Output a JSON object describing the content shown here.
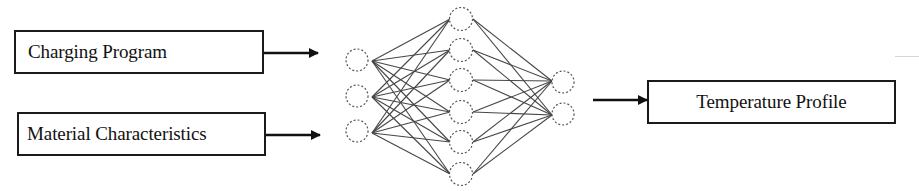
{
  "diagram": {
    "inputs": [
      {
        "label": "Charging Program"
      },
      {
        "label": "Material Characteristics"
      }
    ],
    "output": {
      "label": "Temperature Profile"
    },
    "network": {
      "type": "fully-connected feedforward neural network",
      "layers": [
        {
          "name": "input",
          "node_count": 3
        },
        {
          "name": "hidden",
          "node_count": 6
        },
        {
          "name": "output",
          "node_count": 2
        }
      ],
      "node_style": "dashed circle",
      "edge_color": "#2a2a2a"
    },
    "colors": {
      "stroke": "#1a1a1a",
      "background": "#ffffff"
    }
  }
}
